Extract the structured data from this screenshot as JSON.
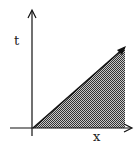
{
  "diagram": {
    "axes": {
      "vertical_label": "t",
      "horizontal_label": "x"
    },
    "region": {
      "shape": "triangle",
      "fill": "crosshatched",
      "vertices": [
        "origin",
        "upper-right",
        "lower-right"
      ]
    },
    "colors": {
      "line": "#111111",
      "hatch": "#333333",
      "background": "#ffffff"
    }
  }
}
